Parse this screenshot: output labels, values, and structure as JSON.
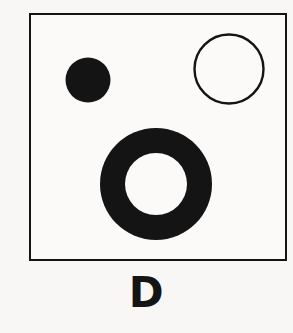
{
  "figure": {
    "label": "D",
    "background_color": "#f8f7f5",
    "ink_color": "#141414",
    "frame": {
      "name": "panel-border",
      "x": 29,
      "y": 13,
      "width": 254,
      "height": 244,
      "stroke_width": 2,
      "stroke_color": "#141414",
      "fill_color": "#fbfaf9"
    },
    "shapes": [
      {
        "id": "small-filled-disc",
        "type": "circle",
        "style": "filled",
        "cx": 88,
        "cy": 80,
        "r": 22.5,
        "diameter": 45,
        "fill": "#141414",
        "stroke": "none",
        "stroke_width": 0
      },
      {
        "id": "large-outlined-circle",
        "type": "circle",
        "style": "outline",
        "cx": 229,
        "cy": 69,
        "r": 34.5,
        "diameter": 69,
        "fill": "none",
        "stroke": "#141414",
        "stroke_width": 2.4
      },
      {
        "id": "annulus-ring",
        "type": "annulus",
        "style": "filled-ring",
        "cx": 156,
        "cy": 184,
        "outer_r": 56,
        "inner_r": 31,
        "outer_diameter": 112,
        "inner_diameter": 62,
        "fill": "#141414",
        "hole_fill": "#fbfaf9"
      }
    ]
  },
  "caption": {
    "text": "D"
  }
}
